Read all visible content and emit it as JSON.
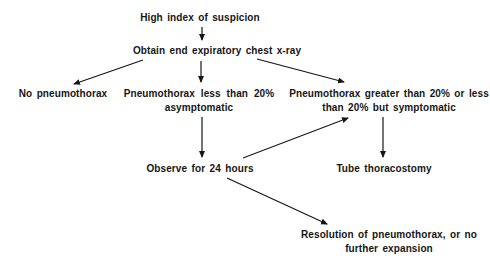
{
  "figure": {
    "type": "flowchart",
    "topic": "Pneumothorax management algorithm",
    "colors": {
      "background": "#ffffff",
      "ink": "#161616"
    }
  },
  "nodes": {
    "suspicion": {
      "label": "High index of suspicion"
    },
    "xray": {
      "label": "Obtain end expiratory chest x-ray"
    },
    "no_pneumothorax": {
      "label": "No pneumothorax"
    },
    "less_than_20": {
      "label": "Pneumothorax less than 20%\nasymptomatic"
    },
    "greater_than_20": {
      "label": "Pneumothorax greater than 20% or less\nthan 20% but symptomatic"
    },
    "observe": {
      "label": "Observe for 24 hours"
    },
    "tube_thoracostomy": {
      "label": "Tube thoracostomy"
    },
    "resolution": {
      "label": "Resolution of pneumothorax, or no\nfurther expansion"
    }
  },
  "edges": [
    {
      "from": "High index of suspicion",
      "to": "Obtain end expiratory chest x-ray"
    },
    {
      "from": "Obtain end expiratory chest x-ray",
      "to": "No pneumothorax"
    },
    {
      "from": "Obtain end expiratory chest x-ray",
      "to": "Pneumothorax less than 20% asymptomatic"
    },
    {
      "from": "Obtain end expiratory chest x-ray",
      "to": "Pneumothorax greater than 20% or less than 20% but symptomatic"
    },
    {
      "from": "Pneumothorax less than 20% asymptomatic",
      "to": "Observe for 24 hours"
    },
    {
      "from": "Observe for 24 hours",
      "to": "Pneumothorax greater than 20% or less than 20% but symptomatic"
    },
    {
      "from": "Pneumothorax greater than 20% or less than 20% but symptomatic",
      "to": "Tube thoracostomy"
    },
    {
      "from": "Observe for 24 hours",
      "to": "Resolution of pneumothorax, or no further expansion"
    }
  ]
}
